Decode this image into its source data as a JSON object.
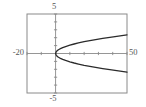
{
  "figure": {
    "background": "#ffffff"
  },
  "chart_data": {
    "type": "line",
    "title": "",
    "xlabel": "",
    "ylabel": "",
    "xlim": [
      -20,
      50
    ],
    "ylim": [
      -5,
      5
    ],
    "x_tick_step": 10,
    "y_tick_step": 1,
    "grid": false,
    "frame": true,
    "legend": "none",
    "edge_labels": {
      "top": "5",
      "bottom": "-5",
      "left": "-20",
      "right": "50"
    },
    "series": [
      {
        "name": "upper-branch",
        "x": [
          0,
          0.5,
          1,
          2,
          3,
          5,
          7,
          10,
          13,
          16,
          20,
          24,
          28,
          33,
          38,
          44,
          50
        ],
        "y": [
          0,
          0.236,
          0.333,
          0.471,
          0.577,
          0.745,
          0.882,
          1.054,
          1.202,
          1.333,
          1.491,
          1.633,
          1.764,
          1.915,
          2.055,
          2.211,
          2.357
        ]
      },
      {
        "name": "lower-branch",
        "x": [
          0,
          0.5,
          1,
          2,
          3,
          5,
          7,
          10,
          13,
          16,
          20,
          24,
          28,
          33,
          38,
          44,
          50
        ],
        "y": [
          0,
          -0.236,
          -0.333,
          -0.471,
          -0.577,
          -0.745,
          -0.882,
          -1.054,
          -1.202,
          -1.333,
          -1.491,
          -1.633,
          -1.764,
          -1.915,
          -2.055,
          -2.211,
          -2.357
        ]
      }
    ],
    "colors": {
      "curve": "#2b2b2b",
      "axis": "#8a8a8a",
      "frame": "#8a8a8a",
      "label": "#555555"
    }
  }
}
